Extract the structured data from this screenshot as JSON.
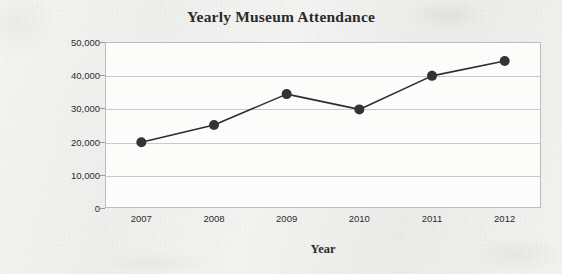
{
  "chart_data": {
    "type": "line",
    "title": "Yearly Museum Attendance",
    "xlabel": "Year",
    "ylabel": "Attendance",
    "categories": [
      "2007",
      "2008",
      "2009",
      "2010",
      "2011",
      "2012"
    ],
    "values": [
      19800,
      25000,
      34300,
      29700,
      39800,
      44300
    ],
    "series": [
      {
        "name": "Attendance",
        "values": [
          19800,
          25000,
          34300,
          29700,
          39800,
          44300
        ]
      }
    ],
    "ylim": [
      0,
      50000
    ],
    "y_ticks": [
      0,
      10000,
      20000,
      30000,
      40000,
      50000
    ],
    "y_tick_labels": [
      "0",
      "10,000",
      "20,000",
      "30,000",
      "40,000",
      "50,000"
    ],
    "x_tick_labels": [
      "2007",
      "2008",
      "2009",
      "2010",
      "2011",
      "2012"
    ],
    "grid": "horizontal",
    "legend": "none",
    "marker": "filled-circle",
    "line_color": "#2e2e2e",
    "marker_color": "#333333",
    "grid_color": "#c9c9c9",
    "frame_color": "#bdbdbd",
    "plot_background": "#fcfcfb",
    "page_background": "#f2f2f0"
  }
}
